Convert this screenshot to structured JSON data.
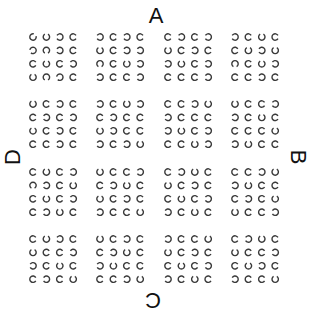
{
  "labels": {
    "top": "A",
    "right": "B",
    "bottom": "C",
    "left": "D"
  },
  "ring_style": {
    "color": "#3a3a3a",
    "radius": 3.2,
    "stroke_width": 1.4,
    "gap_degrees": 60
  },
  "layout": {
    "block_origins_x": [
      33,
      100,
      168,
      235
    ],
    "block_origins_y": [
      37,
      104,
      172,
      239
    ],
    "ring_pitch": 13.4,
    "rings_per_block": 4
  },
  "blocks": [
    [
      [
        [
          45,
          90,
          180,
          0
        ],
        [
          200,
          270,
          180,
          0
        ],
        [
          0,
          90,
          0,
          180
        ],
        [
          90,
          270,
          200,
          0
        ]
      ],
      [
        [
          180,
          0,
          180,
          0
        ],
        [
          90,
          0,
          180,
          180
        ],
        [
          270,
          0,
          90,
          180
        ],
        [
          180,
          0,
          0,
          180
        ]
      ],
      [
        [
          0,
          180,
          0,
          180
        ],
        [
          90,
          0,
          180,
          0
        ],
        [
          180,
          90,
          0,
          180
        ],
        [
          0,
          0,
          0,
          180
        ]
      ],
      [
        [
          180,
          0,
          90,
          0
        ],
        [
          0,
          90,
          180,
          90
        ],
        [
          270,
          0,
          90,
          180
        ],
        [
          0,
          0,
          180,
          0
        ]
      ]
    ],
    [
      [
        [
          90,
          0,
          180,
          0
        ],
        [
          0,
          180,
          0,
          180
        ],
        [
          90,
          0,
          180,
          0
        ],
        [
          0,
          0,
          180,
          0
        ]
      ],
      [
        [
          180,
          0,
          90,
          180
        ],
        [
          0,
          180,
          0,
          0
        ],
        [
          90,
          180,
          0,
          0
        ],
        [
          180,
          0,
          180,
          90
        ]
      ],
      [
        [
          0,
          0,
          180,
          90
        ],
        [
          180,
          0,
          0,
          0
        ],
        [
          180,
          90,
          0,
          180
        ],
        [
          0,
          0,
          90,
          180
        ]
      ],
      [
        [
          90,
          0,
          0,
          180
        ],
        [
          180,
          0,
          90,
          0
        ],
        [
          0,
          0,
          0,
          90
        ],
        [
          180,
          90,
          0,
          0
        ]
      ]
    ],
    [
      [
        [
          0,
          90,
          0,
          180
        ],
        [
          270,
          180,
          0,
          90
        ],
        [
          0,
          90,
          0,
          180
        ],
        [
          0,
          180,
          90,
          0
        ]
      ],
      [
        [
          90,
          0,
          0,
          180
        ],
        [
          0,
          180,
          90,
          0
        ],
        [
          90,
          0,
          180,
          0
        ],
        [
          180,
          0,
          0,
          90
        ]
      ],
      [
        [
          0,
          180,
          90,
          0
        ],
        [
          90,
          0,
          180,
          0
        ],
        [
          0,
          90,
          0,
          180
        ],
        [
          180,
          0,
          90,
          0
        ]
      ],
      [
        [
          0,
          0,
          180,
          90
        ],
        [
          180,
          90,
          0,
          0
        ],
        [
          0,
          180,
          0,
          90
        ],
        [
          90,
          0,
          0,
          180
        ]
      ]
    ],
    [
      [
        [
          0,
          90,
          180,
          0
        ],
        [
          90,
          0,
          0,
          180
        ],
        [
          180,
          0,
          90,
          0
        ],
        [
          0,
          180,
          0,
          90
        ]
      ],
      [
        [
          90,
          0,
          180,
          0
        ],
        [
          0,
          180,
          90,
          0
        ],
        [
          180,
          90,
          0,
          0
        ],
        [
          0,
          0,
          180,
          90
        ]
      ],
      [
        [
          180,
          0,
          0,
          90
        ],
        [
          90,
          0,
          180,
          0
        ],
        [
          0,
          90,
          0,
          180
        ],
        [
          180,
          0,
          90,
          0
        ]
      ],
      [
        [
          0,
          180,
          90,
          0
        ],
        [
          90,
          0,
          0,
          180
        ],
        [
          0,
          90,
          180,
          0
        ],
        [
          180,
          0,
          0,
          90
        ]
      ]
    ]
  ]
}
